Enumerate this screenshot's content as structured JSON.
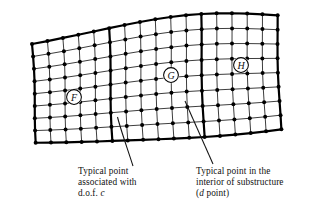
{
  "figure": {
    "type": "finite-element-mesh-diagram",
    "substructure_labels": [
      {
        "text": "F",
        "cx": 74,
        "cy": 97
      },
      {
        "text": "G",
        "cx": 171,
        "cy": 75
      },
      {
        "text": "H",
        "cx": 241,
        "cy": 65
      }
    ],
    "mesh": {
      "columns": 16,
      "rows": 8,
      "node_marker": "filled-circle",
      "divider_columns": [
        5,
        11
      ]
    },
    "colors": {
      "ink": "#111111",
      "paper": "#ffffff",
      "grid_line": "#1a1a1a",
      "heavy_line": "#000000"
    }
  },
  "captions": {
    "left": {
      "line1": "Typical point",
      "line2": "associated with",
      "line3_prefix": "d.o.f. ",
      "line3_italic": "c"
    },
    "right": {
      "line1": "Typical point in the",
      "line2": "interior of substructure",
      "line3_paren_open": "(",
      "line3_italic": "d",
      "line3_suffix": " point)"
    }
  }
}
